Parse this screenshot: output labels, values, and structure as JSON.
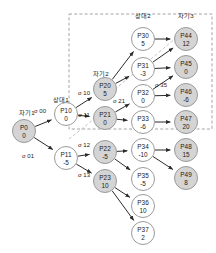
{
  "diagram": {
    "kind": "game-search-tree",
    "colors": {
      "node_fill_shaded": "#d4d4d4",
      "node_fill_open": "#ffffff",
      "node_stroke": "#9a9a9a",
      "edge_stroke": "#2b2b2b",
      "dashed_stroke": "#9a9a9a",
      "cut_line_stroke": "#bdbdbd",
      "background": "#ffffff",
      "text": "#1a1a1a"
    },
    "tier_labels": [
      {
        "id": "tier-self-1",
        "text": "자기1",
        "x": 27,
        "y": 115
      },
      {
        "id": "tier-opponent-1",
        "text": "상대1",
        "x": 61,
        "y": 102
      },
      {
        "id": "tier-self-2",
        "text": "자기2",
        "x": 101,
        "y": 76
      },
      {
        "id": "tier-opponent-2",
        "text": "상대2",
        "x": 143,
        "y": 18
      },
      {
        "id": "tier-self-3",
        "text": "자기3",
        "x": 186,
        "y": 18
      }
    ],
    "nodes": [
      {
        "id": "P0",
        "label": "P0",
        "value": "0",
        "x": 24,
        "y": 131,
        "r": 11.5,
        "shaded": true
      },
      {
        "id": "P10",
        "label": "P10",
        "value": "0",
        "x": 66,
        "y": 114,
        "r": 11.5,
        "shaded": false
      },
      {
        "id": "P11",
        "label": "P11",
        "value": "-5",
        "x": 66,
        "y": 158,
        "r": 11.5,
        "shaded": false
      },
      {
        "id": "P20",
        "label": "P20",
        "value": "5",
        "x": 105,
        "y": 89,
        "r": 11.5,
        "shaded": true
      },
      {
        "id": "P21",
        "label": "P21",
        "value": "0",
        "x": 105,
        "y": 118,
        "r": 11.5,
        "shaded": true
      },
      {
        "id": "P22",
        "label": "P22",
        "value": "-5",
        "x": 105,
        "y": 152,
        "r": 11.5,
        "shaded": true
      },
      {
        "id": "P23",
        "label": "P23",
        "value": "10",
        "x": 105,
        "y": 181,
        "r": 11.5,
        "shaded": true
      },
      {
        "id": "P30",
        "label": "P30",
        "value": "5",
        "x": 143,
        "y": 39,
        "r": 11.5,
        "shaded": false
      },
      {
        "id": "P31",
        "label": "P31",
        "value": "-3",
        "x": 143,
        "y": 69,
        "r": 11.5,
        "shaded": false
      },
      {
        "id": "P32",
        "label": "P32",
        "value": "0",
        "x": 143,
        "y": 96,
        "r": 11.5,
        "shaded": false
      },
      {
        "id": "P33",
        "label": "P33",
        "value": "-6",
        "x": 143,
        "y": 122,
        "r": 11.5,
        "shaded": false
      },
      {
        "id": "P34",
        "label": "P34",
        "value": "-10",
        "x": 143,
        "y": 150,
        "r": 11.5,
        "shaded": false
      },
      {
        "id": "P35",
        "label": "P35",
        "value": "-5",
        "x": 143,
        "y": 179,
        "r": 11.5,
        "shaded": false
      },
      {
        "id": "P36",
        "label": "P36",
        "value": "10",
        "x": 143,
        "y": 206,
        "r": 11.5,
        "shaded": false
      },
      {
        "id": "P37",
        "label": "P37",
        "value": "2",
        "x": 143,
        "y": 233,
        "r": 11.5,
        "shaded": false
      },
      {
        "id": "P44",
        "label": "P44",
        "value": "12",
        "x": 186,
        "y": 39,
        "r": 11.5,
        "shaded": true
      },
      {
        "id": "P45",
        "label": "P45",
        "value": "0",
        "x": 186,
        "y": 67,
        "r": 11.5,
        "shaded": true
      },
      {
        "id": "P46",
        "label": "P46",
        "value": "-6",
        "x": 186,
        "y": 95,
        "r": 11.5,
        "shaded": true
      },
      {
        "id": "P47",
        "label": "P47",
        "value": "20",
        "x": 186,
        "y": 122,
        "r": 11.5,
        "shaded": true
      },
      {
        "id": "P48",
        "label": "P48",
        "value": "15",
        "x": 186,
        "y": 150,
        "r": 11.5,
        "shaded": true
      },
      {
        "id": "P49",
        "label": "P49",
        "value": "8",
        "x": 186,
        "y": 178,
        "r": 11.5,
        "shaded": true
      }
    ],
    "edges": [
      {
        "id": "e-P0-P10",
        "from": "P0",
        "to": "P10"
      },
      {
        "id": "e-P0-P11",
        "from": "P0",
        "to": "P11"
      },
      {
        "id": "e-P10-P20",
        "from": "P10",
        "to": "P20"
      },
      {
        "id": "e-P10-P21",
        "from": "P10",
        "to": "P21"
      },
      {
        "id": "e-P11-P22",
        "from": "P11",
        "to": "P22"
      },
      {
        "id": "e-P11-P23",
        "from": "P11",
        "to": "P23"
      },
      {
        "id": "e-P20-P30",
        "from": "P20",
        "to": "P30"
      },
      {
        "id": "e-P20-P31",
        "from": "P20",
        "to": "P31"
      },
      {
        "id": "e-P21-P32",
        "from": "P21",
        "to": "P32"
      },
      {
        "id": "e-P21-P33",
        "from": "P21",
        "to": "P33"
      },
      {
        "id": "e-P22-P34",
        "from": "P22",
        "to": "P34"
      },
      {
        "id": "e-P22-P35",
        "from": "P22",
        "to": "P35"
      },
      {
        "id": "e-P23-P36",
        "from": "P23",
        "to": "P36"
      },
      {
        "id": "e-P23-P37",
        "from": "P23",
        "to": "P37"
      },
      {
        "id": "e-P30-P44",
        "from": "P30",
        "to": "P44"
      },
      {
        "id": "e-P31-P44",
        "from": "P31",
        "to": "P44"
      },
      {
        "id": "e-P31-P45",
        "from": "P31",
        "to": "P45"
      },
      {
        "id": "e-P32-P45",
        "from": "P32",
        "to": "P45"
      },
      {
        "id": "e-P32-P46",
        "from": "P32",
        "to": "P46"
      },
      {
        "id": "e-P33-P47",
        "from": "P33",
        "to": "P47"
      },
      {
        "id": "e-P34-P48",
        "from": "P34",
        "to": "P48"
      },
      {
        "id": "e-P34-P49",
        "from": "P34",
        "to": "P49"
      }
    ],
    "edge_labels": [
      {
        "id": "sigma-00",
        "text": "σ 00",
        "x": 40,
        "y": 113
      },
      {
        "id": "sigma-01",
        "text": "σ 01",
        "x": 28,
        "y": 158
      },
      {
        "id": "sigma-10",
        "text": "σ 10",
        "x": 84,
        "y": 95
      },
      {
        "id": "sigma-11",
        "text": "σ 11",
        "x": 84,
        "y": 117
      },
      {
        "id": "sigma-12",
        "text": "σ 12",
        "x": 84,
        "y": 147
      },
      {
        "id": "sigma-13",
        "text": "σ 13",
        "x": 84,
        "y": 177
      },
      {
        "id": "sigma-21",
        "text": "σ 21",
        "x": 119,
        "y": 103
      },
      {
        "id": "sigma-35",
        "text": "σ 35",
        "x": 161,
        "y": 87
      }
    ],
    "region": {
      "id": "pruned-region",
      "x": 69,
      "y": 14,
      "width": 143,
      "height": 115
    },
    "cut_lines": [
      {
        "id": "cut-line-upper",
        "x1": 107,
        "y1": 96,
        "x2": 183,
        "y2": 32
      },
      {
        "id": "cut-line-lower",
        "x1": 69,
        "y1": 139,
        "x2": 103,
        "y2": 112
      }
    ]
  }
}
